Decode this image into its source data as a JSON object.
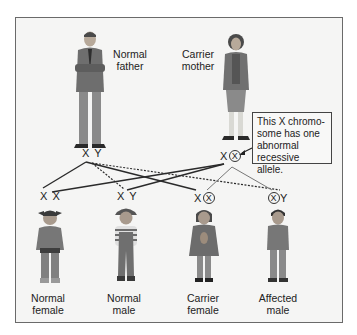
{
  "figure": {
    "parents": {
      "father": {
        "label_line1": "Normal",
        "label_line2": "father",
        "chromosomes": "X Y"
      },
      "mother": {
        "label_line1": "Carrier",
        "label_line2": "mother",
        "chromosome_normal": "X",
        "chromosome_abnormal": "X"
      }
    },
    "callout": {
      "text": "This X chromo-some has one abnormal recessive allele.",
      "line1": "This X chromo-",
      "line2": "some has one",
      "line3": "abnormal",
      "line4": "recessive allele."
    },
    "children": [
      {
        "label_line1": "Normal",
        "label_line2": "female",
        "chrom_a": "X",
        "chrom_b": "X",
        "circled": "none"
      },
      {
        "label_line1": "Normal",
        "label_line2": "male",
        "chrom_a": "X",
        "chrom_b": "Y",
        "circled": "none"
      },
      {
        "label_line1": "Carrier",
        "label_line2": "female",
        "chrom_a": "X",
        "chrom_b": "X",
        "circled": "second"
      },
      {
        "label_line1": "Affected",
        "label_line2": "male",
        "chrom_a": "X",
        "chrom_b": "Y",
        "circled": "first"
      }
    ],
    "colors": {
      "frame_bg": "#f5f5f4",
      "frame_border": "#6a6a6a",
      "line_dark": "#2a2a2a",
      "line_light": "#777777",
      "clothing": "#7a7a7a"
    }
  }
}
